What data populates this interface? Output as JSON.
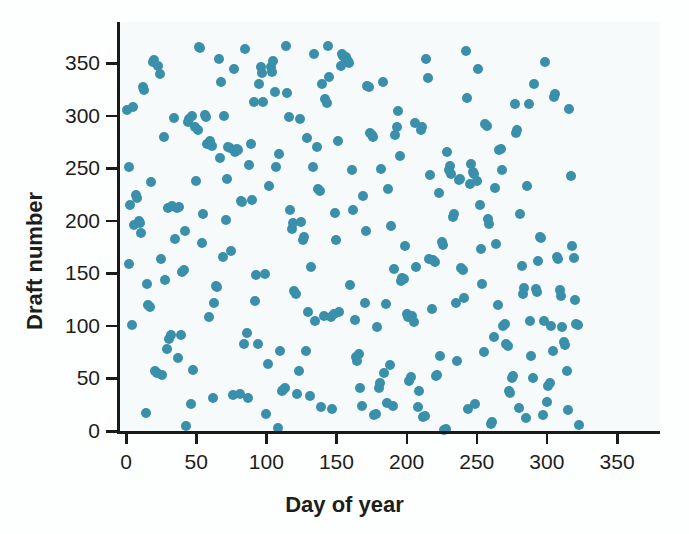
{
  "figure": {
    "width": 689,
    "height": 534,
    "background_color": "#fdfefe",
    "plot_field_color": "#f6fafa"
  },
  "axes": {
    "line_color": "#1a1a1a",
    "x_title": "Day of year",
    "y_title": "Draft number",
    "x_ticks": [
      0,
      50,
      100,
      150,
      200,
      250,
      300,
      350
    ],
    "y_ticks": [
      0,
      50,
      100,
      150,
      200,
      250,
      300,
      350
    ],
    "x_pixel_0": 126,
    "x_pixel_per_unit": 1.403,
    "y_pixel_0": 431,
    "y_pixel_per_unit": 1.051,
    "plot_left_px": 117,
    "plot_right_px": 660,
    "plot_top_px": 22,
    "plot_bottom_px": 431
  },
  "chart_data": {
    "type": "scatter",
    "title": "",
    "subtitle": "",
    "xlabel": "Day of year",
    "ylabel": "Draft number",
    "xlim": [
      -6,
      380
    ],
    "ylim": [
      -8,
      372
    ],
    "xticks": [
      0,
      50,
      100,
      150,
      200,
      250,
      300,
      350
    ],
    "yticks": [
      0,
      50,
      100,
      150,
      200,
      250,
      300,
      350
    ],
    "grid": false,
    "legend": null,
    "marker": {
      "shape": "circle",
      "color": "#3a8fab",
      "diameter_px": 10,
      "opacity": 1
    },
    "annotations": [],
    "series": [
      {
        "name": "draft lottery",
        "points": [
          [
            1,
            305
          ],
          [
            2,
            159
          ],
          [
            2,
            251
          ],
          [
            3,
            215
          ],
          [
            4,
            101
          ],
          [
            5,
            308
          ],
          [
            6,
            196
          ],
          [
            7,
            225
          ],
          [
            8,
            222
          ],
          [
            9,
            200
          ],
          [
            10,
            198
          ],
          [
            11,
            188
          ],
          [
            12,
            327
          ],
          [
            13,
            324
          ],
          [
            14,
            17
          ],
          [
            15,
            140
          ],
          [
            16,
            120
          ],
          [
            17,
            118
          ],
          [
            18,
            237
          ],
          [
            19,
            351
          ],
          [
            20,
            353
          ],
          [
            21,
            57
          ],
          [
            22,
            55
          ],
          [
            23,
            347
          ],
          [
            24,
            340
          ],
          [
            25,
            164
          ],
          [
            26,
            53
          ],
          [
            27,
            280
          ],
          [
            28,
            144
          ],
          [
            29,
            78
          ],
          [
            30,
            212
          ],
          [
            31,
            88
          ],
          [
            32,
            91
          ],
          [
            33,
            214
          ],
          [
            34,
            298
          ],
          [
            35,
            183
          ],
          [
            36,
            212
          ],
          [
            37,
            69
          ],
          [
            38,
            213
          ],
          [
            39,
            91
          ],
          [
            40,
            151
          ],
          [
            41,
            153
          ],
          [
            42,
            190
          ],
          [
            43,
            5
          ],
          [
            44,
            294
          ],
          [
            45,
            297
          ],
          [
            46,
            26
          ],
          [
            47,
            300
          ],
          [
            48,
            58
          ],
          [
            49,
            289
          ],
          [
            50,
            238
          ],
          [
            51,
            286
          ],
          [
            52,
            365
          ],
          [
            53,
            364
          ],
          [
            54,
            179
          ],
          [
            55,
            206
          ],
          [
            56,
            301
          ],
          [
            57,
            299
          ],
          [
            58,
            273
          ],
          [
            59,
            108
          ],
          [
            60,
            276
          ],
          [
            61,
            271
          ],
          [
            62,
            31
          ],
          [
            63,
            122
          ],
          [
            64,
            138
          ],
          [
            65,
            137
          ],
          [
            66,
            354
          ],
          [
            67,
            260
          ],
          [
            68,
            332
          ],
          [
            69,
            166
          ],
          [
            70,
            300
          ],
          [
            71,
            201
          ],
          [
            72,
            240
          ],
          [
            73,
            270
          ],
          [
            74,
            269
          ],
          [
            75,
            171
          ],
          [
            76,
            34
          ],
          [
            77,
            344
          ],
          [
            78,
            265
          ],
          [
            79,
            268
          ],
          [
            80,
            267
          ],
          [
            81,
            35
          ],
          [
            82,
            219
          ],
          [
            83,
            218
          ],
          [
            84,
            83
          ],
          [
            85,
            363
          ],
          [
            86,
            93
          ],
          [
            87,
            31
          ],
          [
            88,
            253
          ],
          [
            89,
            273
          ],
          [
            90,
            220
          ],
          [
            91,
            313
          ],
          [
            92,
            124
          ],
          [
            93,
            148
          ],
          [
            94,
            83
          ],
          [
            95,
            330
          ],
          [
            96,
            346
          ],
          [
            97,
            341
          ],
          [
            98,
            313
          ],
          [
            99,
            149
          ],
          [
            100,
            16
          ],
          [
            101,
            64
          ],
          [
            102,
            233
          ],
          [
            103,
            346
          ],
          [
            104,
            342
          ],
          [
            105,
            352
          ],
          [
            106,
            323
          ],
          [
            107,
            251
          ],
          [
            108,
            3
          ],
          [
            109,
            264
          ],
          [
            110,
            76
          ],
          [
            111,
            38
          ],
          [
            112,
            39
          ],
          [
            113,
            41
          ],
          [
            114,
            366
          ],
          [
            115,
            322
          ],
          [
            116,
            299
          ],
          [
            117,
            210
          ],
          [
            118,
            192
          ],
          [
            119,
            198
          ],
          [
            120,
            133
          ],
          [
            121,
            130
          ],
          [
            122,
            35
          ],
          [
            123,
            57
          ],
          [
            124,
            297
          ],
          [
            125,
            199
          ],
          [
            126,
            182
          ],
          [
            127,
            185
          ],
          [
            128,
            76
          ],
          [
            129,
            279
          ],
          [
            130,
            113
          ],
          [
            131,
            33
          ],
          [
            132,
            156
          ],
          [
            133,
            251
          ],
          [
            134,
            359
          ],
          [
            135,
            105
          ],
          [
            136,
            270
          ],
          [
            137,
            230
          ],
          [
            138,
            228
          ],
          [
            139,
            23
          ],
          [
            140,
            330
          ],
          [
            141,
            109
          ],
          [
            142,
            316
          ],
          [
            143,
            312
          ],
          [
            144,
            366
          ],
          [
            145,
            337
          ],
          [
            146,
            108
          ],
          [
            147,
            21
          ],
          [
            148,
            111
          ],
          [
            149,
            207
          ],
          [
            150,
            182
          ],
          [
            151,
            276
          ],
          [
            152,
            113
          ],
          [
            153,
            347
          ],
          [
            154,
            359
          ],
          [
            155,
            357
          ],
          [
            156,
            355
          ],
          [
            157,
            356
          ],
          [
            158,
            352
          ],
          [
            159,
            350
          ],
          [
            160,
            139
          ],
          [
            161,
            248
          ],
          [
            162,
            210
          ],
          [
            163,
            106
          ],
          [
            164,
            70
          ],
          [
            165,
            67
          ],
          [
            166,
            73
          ],
          [
            167,
            41
          ],
          [
            168,
            24
          ],
          [
            169,
            224
          ],
          [
            170,
            122
          ],
          [
            171,
            190
          ],
          [
            172,
            328
          ],
          [
            173,
            327
          ],
          [
            174,
            284
          ],
          [
            175,
            282
          ],
          [
            176,
            280
          ],
          [
            177,
            15
          ],
          [
            178,
            16
          ],
          [
            179,
            99
          ],
          [
            180,
            41
          ],
          [
            181,
            46
          ],
          [
            182,
            249
          ],
          [
            183,
            332
          ],
          [
            184,
            55
          ],
          [
            185,
            121
          ],
          [
            186,
            27
          ],
          [
            187,
            230
          ],
          [
            188,
            63
          ],
          [
            189,
            195
          ],
          [
            190,
            24
          ],
          [
            191,
            154
          ],
          [
            192,
            282
          ],
          [
            193,
            289
          ],
          [
            194,
            304
          ],
          [
            195,
            262
          ],
          [
            196,
            143
          ],
          [
            197,
            146
          ],
          [
            198,
            145
          ],
          [
            199,
            176
          ],
          [
            200,
            111
          ],
          [
            201,
            108
          ],
          [
            202,
            48
          ],
          [
            203,
            51
          ],
          [
            204,
            109
          ],
          [
            205,
            104
          ],
          [
            206,
            293
          ],
          [
            207,
            156
          ],
          [
            208,
            23
          ],
          [
            209,
            38
          ],
          [
            210,
            286
          ],
          [
            211,
            289
          ],
          [
            212,
            13
          ],
          [
            213,
            14
          ],
          [
            214,
            354
          ],
          [
            215,
            336
          ],
          [
            216,
            164
          ],
          [
            217,
            244
          ],
          [
            218,
            116
          ],
          [
            219,
            163
          ],
          [
            220,
            161
          ],
          [
            221,
            52
          ],
          [
            222,
            53
          ],
          [
            223,
            226
          ],
          [
            224,
            71
          ],
          [
            225,
            180
          ],
          [
            226,
            177
          ],
          [
            227,
            1
          ],
          [
            228,
            2
          ],
          [
            229,
            265
          ],
          [
            230,
            248
          ],
          [
            231,
            252
          ],
          [
            232,
            245
          ],
          [
            233,
            204
          ],
          [
            234,
            206
          ],
          [
            235,
            122
          ],
          [
            236,
            67
          ],
          [
            237,
            239
          ],
          [
            238,
            240
          ],
          [
            239,
            155
          ],
          [
            240,
            153
          ],
          [
            241,
            127
          ],
          [
            242,
            362
          ],
          [
            243,
            317
          ],
          [
            244,
            21
          ],
          [
            245,
            235
          ],
          [
            246,
            254
          ],
          [
            247,
            246
          ],
          [
            248,
            245
          ],
          [
            249,
            26
          ],
          [
            250,
            238
          ],
          [
            251,
            344
          ],
          [
            252,
            215
          ],
          [
            253,
            173
          ],
          [
            254,
            140
          ],
          [
            255,
            75
          ],
          [
            256,
            292
          ],
          [
            257,
            290
          ],
          [
            258,
            202
          ],
          [
            259,
            197
          ],
          [
            260,
            7
          ],
          [
            261,
            9
          ],
          [
            262,
            89
          ],
          [
            263,
            231
          ],
          [
            264,
            178
          ],
          [
            265,
            120
          ],
          [
            266,
            267
          ],
          [
            267,
            268
          ],
          [
            268,
            248
          ],
          [
            269,
            100
          ],
          [
            270,
            102
          ],
          [
            271,
            83
          ],
          [
            272,
            81
          ],
          [
            273,
            38
          ],
          [
            274,
            36
          ],
          [
            275,
            50
          ],
          [
            276,
            52
          ],
          [
            277,
            311
          ],
          [
            278,
            284
          ],
          [
            279,
            286
          ],
          [
            280,
            22
          ],
          [
            281,
            206
          ],
          [
            282,
            157
          ],
          [
            283,
            130
          ],
          [
            284,
            136
          ],
          [
            285,
            12
          ],
          [
            286,
            233
          ],
          [
            287,
            311
          ],
          [
            288,
            105
          ],
          [
            289,
            71
          ],
          [
            290,
            50
          ],
          [
            291,
            330
          ],
          [
            292,
            135
          ],
          [
            293,
            132
          ],
          [
            294,
            162
          ],
          [
            295,
            185
          ],
          [
            296,
            184
          ],
          [
            297,
            15
          ],
          [
            298,
            105
          ],
          [
            299,
            351
          ],
          [
            300,
            28
          ],
          [
            301,
            43
          ],
          [
            302,
            46
          ],
          [
            303,
            100
          ],
          [
            304,
            76
          ],
          [
            305,
            318
          ],
          [
            306,
            321
          ],
          [
            307,
            166
          ],
          [
            308,
            164
          ],
          [
            309,
            134
          ],
          [
            310,
            128
          ],
          [
            311,
            99
          ],
          [
            312,
            85
          ],
          [
            313,
            82
          ],
          [
            314,
            57
          ],
          [
            315,
            20
          ],
          [
            316,
            306
          ],
          [
            317,
            243
          ],
          [
            318,
            176
          ],
          [
            319,
            165
          ],
          [
            320,
            125
          ],
          [
            321,
            102
          ],
          [
            322,
            101
          ],
          [
            323,
            6
          ]
        ]
      }
    ]
  }
}
